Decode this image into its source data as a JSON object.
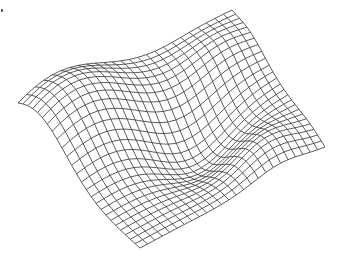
{
  "chart_data": {
    "type": "surface-wireframe",
    "title": "",
    "xlabel": "",
    "ylabel": "",
    "zlabel": "",
    "grid_resolution": [
      25,
      25
    ],
    "line_color": "#333333",
    "background": "#ffffff",
    "axes_visible": false,
    "projection": {
      "corner_left": [
        18,
        103
      ],
      "corner_top": [
        232,
        10
      ],
      "corner_right": [
        325,
        147
      ],
      "corner_bottom": [
        140,
        248
      ]
    },
    "surface_description": "Smooth undulating surface: high ridge toward the back/top corner, a trough along the middle diagonal, gentle bumps near the front edges.",
    "z_function_terms": [
      {
        "amp": 55,
        "cx": 0.15,
        "cy": 0.15,
        "sx": 0.35,
        "sy": 0.35
      },
      {
        "amp": -30,
        "cx": 0.55,
        "cy": 0.55,
        "sx": 0.25,
        "sy": 0.25
      },
      {
        "amp": 18,
        "cx": 0.85,
        "cy": 0.75,
        "sx": 0.2,
        "sy": 0.2
      },
      {
        "amp": 14,
        "cx": 0.2,
        "cy": 0.85,
        "sx": 0.2,
        "sy": 0.2
      }
    ]
  }
}
